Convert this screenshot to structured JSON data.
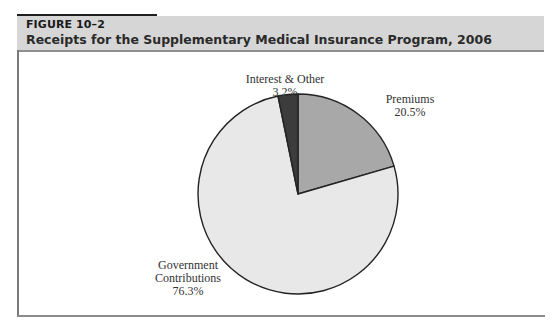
{
  "figure": {
    "label": "FIGURE 10–2",
    "title": "Receipts for the Supplementary Medical Insurance Program, 2006"
  },
  "labels": {
    "interest": {
      "name": "Interest & Other",
      "value": "3.2%"
    },
    "premiums": {
      "name": "Premiums",
      "value": "20.5%"
    },
    "government": {
      "name_line1": "Government",
      "name_line2": "Contributions",
      "value": "76.3%"
    }
  },
  "colors": {
    "premiums": "#a8a8a8",
    "interest": "#3c3c3c",
    "government": "#e8e8e8",
    "header_bg": "#d6d6d6"
  },
  "chart_data": {
    "type": "pie",
    "title": "Receipts for the Supplementary Medical Insurance Program, 2006",
    "categories": [
      "Premiums",
      "Government Contributions",
      "Interest & Other"
    ],
    "values": [
      20.5,
      76.3,
      3.2
    ],
    "unit": "%",
    "start_angle_deg": 0,
    "direction": "clockwise",
    "legend": "none (direct labels)",
    "colors": [
      "#a8a8a8",
      "#e8e8e8",
      "#3c3c3c"
    ]
  }
}
